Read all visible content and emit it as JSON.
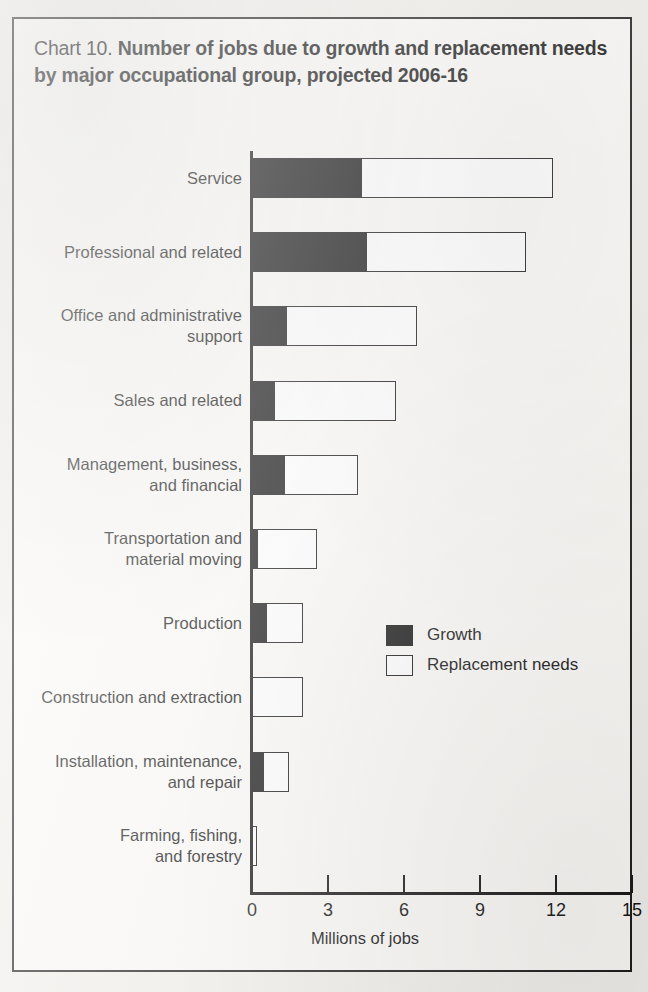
{
  "chart_data": {
    "type": "bar",
    "orientation": "horizontal",
    "stacked": true,
    "title_prefix": "Chart 10.",
    "title": "Number of jobs due to growth and replacement needs by major occupational group, projected 2006-16",
    "title_line1_main": "Number of jobs due to growth and replacement",
    "title_line2_main": "needs by major occupational group, projected 2006-16",
    "xlabel": "Millions of jobs",
    "ylabel": "",
    "xlim": [
      0,
      15
    ],
    "xticks": [
      0,
      3,
      6,
      9,
      12,
      15
    ],
    "xticklabels": [
      "0",
      "3",
      "6",
      "9",
      "12",
      "15"
    ],
    "grid": false,
    "legend_position": "center-right",
    "categories": [
      "Service",
      "Professional and related",
      "Office and administrative support",
      "Sales and related",
      "Management, business, and financial",
      "Transportation and material moving",
      "Production",
      "Construction and extraction",
      "Installation, maintenance, and repair",
      "Farming, fishing, and forestry"
    ],
    "category_label_lines": [
      [
        "Service"
      ],
      [
        "Professional and related"
      ],
      [
        "Office and administrative",
        "support"
      ],
      [
        "Sales and related"
      ],
      [
        "Management, business,",
        "and financial"
      ],
      [
        "Transportation and",
        "material moving"
      ],
      [
        "Production"
      ],
      [
        "Construction and extraction"
      ],
      [
        "Installation, maintenance,",
        "and repair"
      ],
      [
        "Farming, fishing,",
        "and forestry"
      ]
    ],
    "series": [
      {
        "name": "Growth",
        "color": "#141414",
        "values": [
          4.3,
          4.5,
          1.35,
          0.85,
          1.25,
          0.2,
          0.55,
          0.0,
          0.45,
          0.0
        ]
      },
      {
        "name": "Replacement needs",
        "color": "#ffffff",
        "values": [
          7.6,
          6.3,
          5.15,
          4.85,
          2.95,
          2.35,
          1.45,
          2.0,
          1.0,
          0.18
        ]
      }
    ],
    "totals": [
      11.9,
      10.8,
      6.5,
      5.7,
      4.2,
      2.55,
      2.0,
      2.0,
      1.45,
      0.18
    ]
  },
  "legend": {
    "items": [
      {
        "label": "Growth",
        "swatch": "filled"
      },
      {
        "label": "Replacement needs",
        "swatch": "hollow"
      }
    ]
  }
}
